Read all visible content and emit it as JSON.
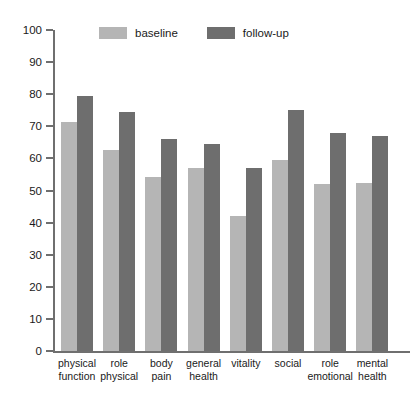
{
  "chart_data": {
    "type": "bar",
    "title": "",
    "subtitle": "",
    "xlabel": "",
    "ylabel": "",
    "ylim": [
      0,
      100
    ],
    "yticks": [
      0,
      10,
      20,
      30,
      40,
      50,
      60,
      70,
      80,
      90,
      100
    ],
    "grid": false,
    "legend_position": "top-center",
    "categories": [
      "physical function",
      "role physical",
      "body pain",
      "general health",
      "vitality",
      "social",
      "role emotional",
      "mental health"
    ],
    "category_lines": [
      [
        "physical",
        "function"
      ],
      [
        "role",
        "physical"
      ],
      [
        "body",
        "pain"
      ],
      [
        "general",
        "health"
      ],
      [
        "vitality",
        ""
      ],
      [
        "social",
        ""
      ],
      [
        "role",
        "emotional"
      ],
      [
        "mental",
        "health"
      ]
    ],
    "series": [
      {
        "name": "baseline",
        "color": "#b5b5b5",
        "values": [
          71.2,
          62.5,
          54.3,
          57.1,
          42.0,
          59.6,
          52.0,
          52.4
        ]
      },
      {
        "name": "follow-up",
        "color": "#6e6e6e",
        "values": [
          79.5,
          74.6,
          66.2,
          64.6,
          57.0,
          75.1,
          68.0,
          67.0
        ]
      }
    ]
  },
  "legend": {
    "entries": [
      {
        "label": "baseline",
        "color": "#b5b5b5"
      },
      {
        "label": "follow-up",
        "color": "#6e6e6e"
      }
    ]
  },
  "axis": {
    "color": "#6f6f6f"
  }
}
